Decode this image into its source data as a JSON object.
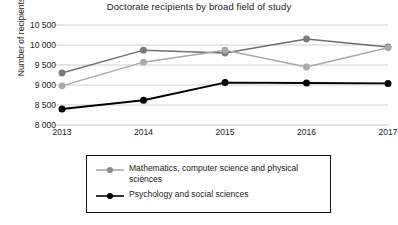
{
  "chart_data": {
    "type": "line",
    "title": "Doctorate recipients by broad field of study",
    "xlabel": "",
    "ylabel": "Number of recipients",
    "categories": [
      "2013",
      "2014",
      "2015",
      "2016",
      "2017"
    ],
    "x": [
      2013,
      2014,
      2015,
      2016,
      2017
    ],
    "ylim": [
      8000,
      10500
    ],
    "yticks": [
      8000,
      8500,
      9000,
      9500,
      10000,
      10500
    ],
    "ytick_labels": [
      "8 000",
      "8 500",
      "9 000",
      "9 500",
      "10 000",
      "10 500"
    ],
    "grid": true,
    "legend_position": "bottom",
    "series": [
      {
        "name": "Life sciences",
        "labeled_in_legend": false,
        "color": "#6e6e6e",
        "marker": "circle",
        "values": [
          9300,
          9870,
          9800,
          10150,
          9950
        ]
      },
      {
        "name": "Mathematics, computer science and physical sciences",
        "labeled_in_legend": true,
        "color": "#a8a8a8",
        "marker": "circle",
        "values": [
          8980,
          9570,
          9870,
          9450,
          9930
        ]
      },
      {
        "name": "Psychology and social sciences",
        "labeled_in_legend": true,
        "color": "#000000",
        "marker": "circle",
        "values": [
          8400,
          8620,
          9060,
          9050,
          9040
        ]
      }
    ]
  },
  "legend": {
    "entries": [
      {
        "label": "Mathematics, computer science and physical sciences",
        "color": "#a8a8a8"
      },
      {
        "label": "Psychology and social sciences",
        "color": "#000000"
      }
    ]
  }
}
